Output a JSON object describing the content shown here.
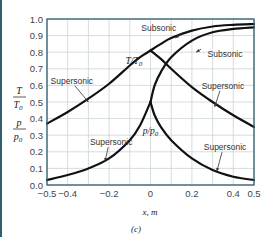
{
  "chart_data": {
    "type": "line",
    "title": "",
    "caption": "(c)",
    "xlabel": "x, m",
    "ylabel": [
      "T/T0",
      "p/p0"
    ],
    "xlim": [
      -0.5,
      0.5
    ],
    "ylim": [
      0.0,
      1.0
    ],
    "grid": true,
    "x_ticks": [
      -0.5,
      -0.4,
      -0.2,
      0,
      0.2,
      0.4,
      0.5
    ],
    "x_tick_labels": [
      "−0.5",
      "−0.4",
      "−0.2",
      "0",
      "0.2",
      "0.4",
      "0.5"
    ],
    "y_ticks": [
      0.0,
      0.1,
      0.2,
      0.3,
      0.4,
      0.5,
      0.6,
      0.7,
      0.8,
      0.9,
      1.0
    ],
    "y_tick_labels": [
      "0.0",
      "0.1",
      "0.2",
      "0.3",
      "0.4",
      "0.5",
      "0.6",
      "0.7",
      "0.8",
      "0.9",
      "1.0"
    ],
    "series": [
      {
        "name": "T/T0 (supersonic, converging)",
        "x": [
          -0.5,
          -0.4,
          -0.3,
          -0.2,
          -0.1,
          -0.05,
          0.0
        ],
        "y": [
          0.37,
          0.44,
          0.52,
          0.61,
          0.72,
          0.77,
          0.81
        ]
      },
      {
        "name": "T/T0 subsonic",
        "x": [
          0.0,
          0.05,
          0.1,
          0.2,
          0.3,
          0.4,
          0.5
        ],
        "y": [
          0.81,
          0.85,
          0.885,
          0.93,
          0.955,
          0.965,
          0.97
        ]
      },
      {
        "name": "T/T0 supersonic",
        "x": [
          0.0,
          0.05,
          0.1,
          0.2,
          0.3,
          0.4,
          0.5
        ],
        "y": [
          0.81,
          0.76,
          0.7,
          0.59,
          0.5,
          0.42,
          0.35
        ]
      },
      {
        "name": "p/p0 (supersonic, converging)",
        "x": [
          -0.5,
          -0.4,
          -0.3,
          -0.2,
          -0.1,
          -0.05,
          0.0
        ],
        "y": [
          0.03,
          0.06,
          0.1,
          0.16,
          0.27,
          0.36,
          0.5
        ]
      },
      {
        "name": "p/p0 subsonic",
        "x": [
          0.0,
          0.02,
          0.05,
          0.1,
          0.2,
          0.3,
          0.4,
          0.5
        ],
        "y": [
          0.5,
          0.6,
          0.68,
          0.77,
          0.87,
          0.92,
          0.94,
          0.95
        ]
      },
      {
        "name": "p/p0 supersonic",
        "x": [
          0.0,
          0.02,
          0.05,
          0.1,
          0.2,
          0.3,
          0.4,
          0.5
        ],
        "y": [
          0.5,
          0.42,
          0.35,
          0.27,
          0.16,
          0.09,
          0.05,
          0.03
        ]
      }
    ],
    "annotations": [
      {
        "text": "Subsonic",
        "x": 0.04,
        "y": 0.93,
        "arrow_to": [
          0.12,
          0.885
        ]
      },
      {
        "text": "Subsonic",
        "x": 0.36,
        "y": 0.77,
        "arrow_to": [
          0.22,
          0.8
        ]
      },
      {
        "text": "T/T0",
        "x": -0.08,
        "y": 0.73
      },
      {
        "text": "Supersonic",
        "x": -0.38,
        "y": 0.61,
        "arrow_to": [
          -0.3,
          0.5
        ]
      },
      {
        "text": "Supersonic",
        "x": 0.35,
        "y": 0.58,
        "arrow_to": [
          0.31,
          0.47
        ]
      },
      {
        "text": "p/p0",
        "x": 0.0,
        "y": 0.31
      },
      {
        "text": "Supersonic",
        "x": -0.19,
        "y": 0.24,
        "arrow_to": [
          -0.22,
          0.14
        ]
      },
      {
        "text": "Supersonic",
        "x": 0.36,
        "y": 0.21,
        "arrow_to": [
          0.32,
          0.08
        ]
      }
    ]
  },
  "labels": {
    "y_label_T_num": "T",
    "y_label_T_den": "T",
    "y_label_T_den_sub": "0",
    "y_label_p_num": "p",
    "y_label_p_den": "p",
    "y_label_p_den_sub": "0",
    "x_axis_label": "x, m",
    "caption": "(c)"
  }
}
